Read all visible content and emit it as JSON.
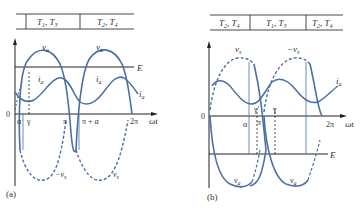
{
  "figure": {
    "colors": {
      "curve": "#4a6fa5",
      "axis": "#222222",
      "text": "#333333"
    },
    "panel_a": {
      "caption": "(a)",
      "table": [
        {
          "label": "T1, T3",
          "main": "T",
          "subs": [
            "1",
            "3"
          ]
        },
        {
          "label": "T2, T4",
          "main": "T",
          "subs": [
            "2",
            "4"
          ]
        }
      ],
      "curve_labels": {
        "va_1": "v",
        "va_2": "v",
        "va_sub": "a",
        "ia_1": "i",
        "ia_2": "i",
        "ia_3": "i",
        "ia_sub": "a",
        "neg_vs": "−v",
        "vs": "v",
        "vs_sub": "s",
        "E": "E"
      },
      "x_ticks": [
        "0",
        "α",
        "γ",
        "π",
        "π + α",
        "2π"
      ],
      "x_axis_label": "ωt"
    },
    "panel_b": {
      "caption": "(b)",
      "table": [
        {
          "label": "T2, T4",
          "main": "T",
          "subs": [
            "2",
            "4"
          ]
        },
        {
          "label": "T1, T3",
          "main": "T",
          "subs": [
            "1",
            "3"
          ]
        },
        {
          "label": "T2, T4",
          "main": "T",
          "subs": [
            "2",
            "4"
          ]
        }
      ],
      "curve_labels": {
        "vs": "v",
        "vs_sub": "s",
        "neg_vs": "−v",
        "ia": "i",
        "ia_sub": "a",
        "va_1": "v",
        "va_2": "v",
        "va_sub": "a",
        "E": "E"
      },
      "x_ticks": [
        "0",
        "α",
        "γ′",
        "π",
        "γ",
        "2π"
      ],
      "x_axis_label": "ωt"
    }
  }
}
